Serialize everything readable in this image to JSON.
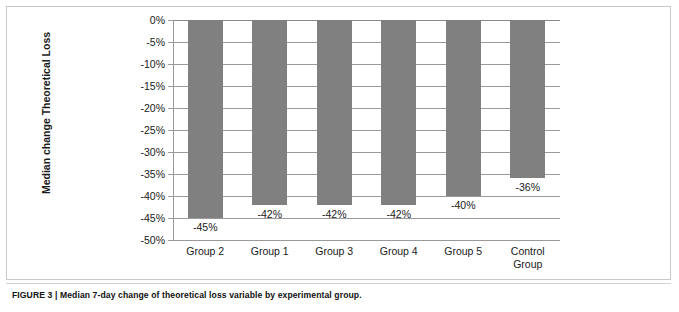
{
  "figure": {
    "caption": "FIGURE 3 | Median 7-day change of theoretical loss variable by experimental group."
  },
  "chart_data": {
    "type": "bar",
    "title": "",
    "xlabel": "",
    "ylabel": "Median change Theoretical Loss",
    "categories": [
      "Group 2",
      "Group 1",
      "Group 3",
      "Group 4",
      "Group 5",
      "Control Group"
    ],
    "values": [
      -45,
      -42,
      -42,
      -42,
      -40,
      -36
    ],
    "value_labels": [
      "-45%",
      "-42%",
      "-42%",
      "-42%",
      "-40%",
      "-36%"
    ],
    "ylim": [
      -50,
      0
    ],
    "ytick_values": [
      0,
      -5,
      -10,
      -15,
      -20,
      -25,
      -30,
      -35,
      -40,
      -45,
      -50
    ],
    "ytick_labels": [
      "0%",
      "-5%",
      "-10%",
      "-15%",
      "-20%",
      "-25%",
      "-30%",
      "-35%",
      "-40%",
      "-45%",
      "-50%"
    ],
    "grid": true,
    "legend": false,
    "bar_color": "#808080",
    "axis_color": "#9a9a9a"
  }
}
